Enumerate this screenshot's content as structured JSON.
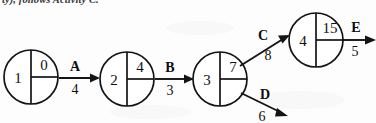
{
  "caption": {
    "text": "ty), follows Activity C."
  },
  "diagram": {
    "type": "activity-on-node-network",
    "nodes": [
      {
        "id": "n1",
        "left_value": "1",
        "top_right_value": "0",
        "cx": 31,
        "cy": 77,
        "r": 27
      },
      {
        "id": "n2",
        "left_value": "2",
        "top_right_value": "4",
        "cx": 127,
        "cy": 79,
        "r": 27
      },
      {
        "id": "n3",
        "left_value": "3",
        "top_right_value": "7",
        "cx": 220,
        "cy": 79,
        "r": 27
      },
      {
        "id": "n4",
        "left_value": "4",
        "top_right_value": "15",
        "cx": 316,
        "cy": 40,
        "r": 27
      }
    ],
    "edges": [
      {
        "id": "eA",
        "letter": "A",
        "duration": "4",
        "from": "n1",
        "to": "n2",
        "direction": "right"
      },
      {
        "id": "eB",
        "letter": "B",
        "duration": "3",
        "from": "n2",
        "to": "n3",
        "direction": "right"
      },
      {
        "id": "eC",
        "letter": "C",
        "duration": "8",
        "from": "n3",
        "to": "n4",
        "direction": "up-right"
      },
      {
        "id": "eD",
        "letter": "D",
        "duration": "6",
        "from": "n3",
        "to": "open",
        "direction": "down-right"
      },
      {
        "id": "eE",
        "letter": "E",
        "duration": "5",
        "from": "n4",
        "to": "open",
        "direction": "right"
      }
    ]
  }
}
